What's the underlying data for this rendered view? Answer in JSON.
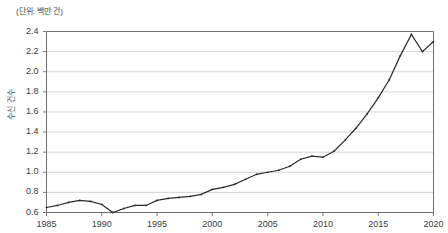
{
  "chart_data": {
    "type": "line",
    "title": "",
    "unit_note": "(단위: 백만 건)",
    "xlabel": "",
    "ylabel": "수신 건수",
    "ylim": [
      0.6,
      2.4
    ],
    "yticks": [
      "0.6",
      "0.8",
      "1.0",
      "1.2",
      "1.4",
      "1.6",
      "1.8",
      "2.0",
      "2.2",
      "2.4"
    ],
    "xlim": [
      1985,
      2020
    ],
    "xticks": [
      "1985",
      "1990",
      "1995",
      "2000",
      "2005",
      "2010",
      "2015",
      "2020"
    ],
    "grid": "horizontal",
    "legend": "none",
    "marker": "small-dot",
    "line_color": "#2b2b2b",
    "grid_color": "#c9c9c9",
    "axis_color": "#6e6e6e",
    "x": [
      1985,
      1986,
      1987,
      1988,
      1989,
      1990,
      1991,
      1992,
      1993,
      1994,
      1995,
      1996,
      1997,
      1998,
      1999,
      2000,
      2001,
      2002,
      2003,
      2004,
      2005,
      2006,
      2007,
      2008,
      2009,
      2010,
      2011,
      2012,
      2013,
      2014,
      2015,
      2016,
      2017,
      2018,
      2019,
      2020
    ],
    "values": [
      0.65,
      0.67,
      0.7,
      0.72,
      0.71,
      0.68,
      0.6,
      0.64,
      0.67,
      0.67,
      0.72,
      0.74,
      0.75,
      0.76,
      0.78,
      0.83,
      0.85,
      0.88,
      0.93,
      0.98,
      1.0,
      1.02,
      1.06,
      1.13,
      1.16,
      1.15,
      1.21,
      1.32,
      1.44,
      1.58,
      1.74,
      1.92,
      2.16,
      2.37,
      2.2,
      2.3
    ]
  }
}
